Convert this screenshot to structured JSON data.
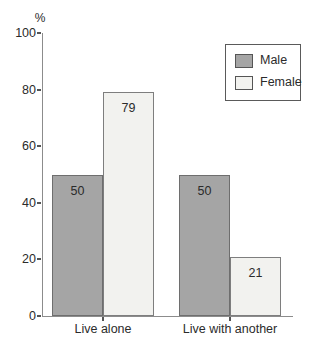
{
  "chart_data": {
    "type": "bar",
    "title": "",
    "xlabel": "",
    "ylabel": "%",
    "categories": [
      "Live alone",
      "Live with another"
    ],
    "series": [
      {
        "name": "Male",
        "values": [
          50,
          50
        ],
        "color": "#a5a5a5",
        "border": "#6e6e6e"
      },
      {
        "name": "Female",
        "values": [
          79,
          21
        ],
        "color": "#f2f2ef",
        "border": "#7e7e7e"
      }
    ],
    "ylim": [
      0,
      100
    ],
    "yticks": [
      0,
      20,
      40,
      60,
      80,
      100
    ],
    "grid": false,
    "legend_position": "top-right",
    "value_labels": true
  },
  "colors": {
    "axis": "#8c8c8c",
    "text": "#2b2b2b",
    "legend_border": "#5a5a5a",
    "background": "#ffffff"
  }
}
